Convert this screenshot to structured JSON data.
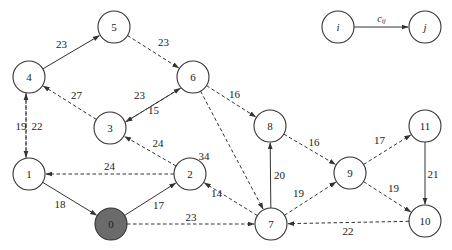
{
  "diagram": {
    "type": "directed-weighted-graph",
    "legend": {
      "from_label": "i",
      "to_label": "j",
      "edge_label": "c",
      "edge_label_subscript": "ij"
    },
    "nodes": [
      {
        "id": "0",
        "label": "0",
        "x": 111,
        "y": 224,
        "highlighted": true
      },
      {
        "id": "1",
        "label": "1",
        "x": 29,
        "y": 174
      },
      {
        "id": "2",
        "label": "2",
        "x": 190,
        "y": 174
      },
      {
        "id": "3",
        "label": "3",
        "x": 110,
        "y": 128
      },
      {
        "id": "4",
        "label": "4",
        "x": 29,
        "y": 77
      },
      {
        "id": "5",
        "label": "5",
        "x": 114,
        "y": 27
      },
      {
        "id": "6",
        "label": "6",
        "x": 193,
        "y": 77
      },
      {
        "id": "7",
        "label": "7",
        "x": 271,
        "y": 224
      },
      {
        "id": "8",
        "label": "8",
        "x": 270,
        "y": 126
      },
      {
        "id": "9",
        "label": "9",
        "x": 350,
        "y": 173
      },
      {
        "id": "10",
        "label": "10",
        "x": 425,
        "y": 221
      },
      {
        "id": "11",
        "label": "11",
        "x": 425,
        "y": 126
      },
      {
        "id": "i",
        "label": "i",
        "x": 338,
        "y": 27,
        "legend": true
      },
      {
        "id": "j",
        "label": "j",
        "x": 425,
        "y": 27,
        "legend": true
      }
    ],
    "edges": [
      {
        "from": "1",
        "to": "0",
        "weight": "18",
        "style": "solid"
      },
      {
        "from": "0",
        "to": "2",
        "weight": "17",
        "style": "solid"
      },
      {
        "from": "0",
        "to": "7",
        "weight": "23",
        "style": "dashed"
      },
      {
        "from": "2",
        "to": "1",
        "weight": "24",
        "style": "dashed"
      },
      {
        "from": "2",
        "to": "3",
        "weight": "24",
        "style": "dashed"
      },
      {
        "from": "1",
        "to": "4",
        "weight": "19",
        "style": "dashed"
      },
      {
        "from": "4",
        "to": "1",
        "weight": "22",
        "style": "dashed"
      },
      {
        "from": "4",
        "to": "5",
        "weight": "23",
        "style": "solid"
      },
      {
        "from": "5",
        "to": "6",
        "weight": "23",
        "style": "dashed"
      },
      {
        "from": "3",
        "to": "4",
        "weight": "27",
        "style": "dashed"
      },
      {
        "from": "6",
        "to": "3",
        "weight": "23",
        "style": "solid"
      },
      {
        "from": "3",
        "to": "6",
        "weight": "15",
        "style": "dashed"
      },
      {
        "from": "6",
        "to": "8",
        "weight": "16",
        "style": "dashed"
      },
      {
        "from": "6",
        "to": "7",
        "weight": "34",
        "style": "dashed"
      },
      {
        "from": "7",
        "to": "2",
        "weight": "14",
        "style": "dashed"
      },
      {
        "from": "7",
        "to": "8",
        "weight": "20",
        "style": "solid"
      },
      {
        "from": "8",
        "to": "9",
        "weight": "16",
        "style": "dashed"
      },
      {
        "from": "7",
        "to": "9",
        "weight": "19",
        "style": "dashed"
      },
      {
        "from": "9",
        "to": "11",
        "weight": "17",
        "style": "dashed"
      },
      {
        "from": "9",
        "to": "10",
        "weight": "19",
        "style": "dashed"
      },
      {
        "from": "11",
        "to": "10",
        "weight": "21",
        "style": "solid"
      },
      {
        "from": "10",
        "to": "7",
        "weight": "22",
        "style": "dashed"
      }
    ],
    "colors": {
      "stroke": "#333333",
      "highlighted_fill": "#6b6b6b",
      "background": "#ffffff"
    }
  }
}
